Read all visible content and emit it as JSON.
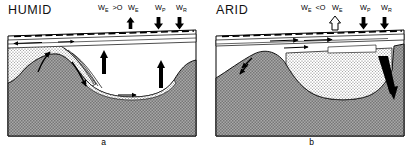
{
  "figure": {
    "type": "cross-section-diagram",
    "panels": [
      {
        "id": "a",
        "title": "HUMID",
        "caption": "a",
        "water_balance_expression": "W",
        "water_balance_subscript": "E",
        "water_balance_relation": ">O",
        "labels": [
          {
            "name": "evaporation-balance",
            "base": "W",
            "sub": "E",
            "relation": ">O"
          },
          {
            "name": "evaporation",
            "base": "W",
            "sub": "E"
          },
          {
            "name": "precipitation",
            "base": "W",
            "sub": "P"
          },
          {
            "name": "runoff",
            "base": "W",
            "sub": "R"
          }
        ],
        "arrows": [
          {
            "name": "evaporation-arrow",
            "direction": "up",
            "style": "solid"
          },
          {
            "name": "precipitation-arrow",
            "direction": "down",
            "style": "solid"
          },
          {
            "name": "runoff-arrow",
            "direction": "down",
            "style": "solid"
          }
        ],
        "features": {
          "water_body": "white open lake with dashed water-table surface",
          "groundwater_flow": "upward discharge arrows into lake",
          "bedrock": "cross-hatched gray basement",
          "aquifer": "stippled permeable unit"
        }
      },
      {
        "id": "b",
        "title": "ARID",
        "caption": "b",
        "water_balance_expression": "W",
        "water_balance_subscript": "E",
        "water_balance_relation": "<O",
        "labels": [
          {
            "name": "evaporation-balance",
            "base": "W",
            "sub": "E",
            "relation": "<O"
          },
          {
            "name": "evaporation",
            "base": "W",
            "sub": "E"
          },
          {
            "name": "precipitation",
            "base": "W",
            "sub": "P"
          },
          {
            "name": "runoff",
            "base": "W",
            "sub": "R"
          }
        ],
        "arrows": [
          {
            "name": "evaporation-arrow",
            "direction": "up",
            "style": "hollow"
          },
          {
            "name": "precipitation-arrow",
            "direction": "down",
            "style": "solid"
          },
          {
            "name": "runoff-arrow",
            "direction": "down",
            "style": "solid"
          }
        ],
        "features": {
          "water_body": "thin surface layer with dashed water table",
          "groundwater_flow": "lateral rightward flow arrows and downward recharge",
          "bedrock": "cross-hatched gray basement",
          "aquifer": "stippled permeable unit filling basin"
        }
      }
    ],
    "colors": {
      "bedrock": "#9a9a9a",
      "stipple": "#d8d8d8",
      "water": "#ffffff",
      "line": "#000000"
    }
  }
}
